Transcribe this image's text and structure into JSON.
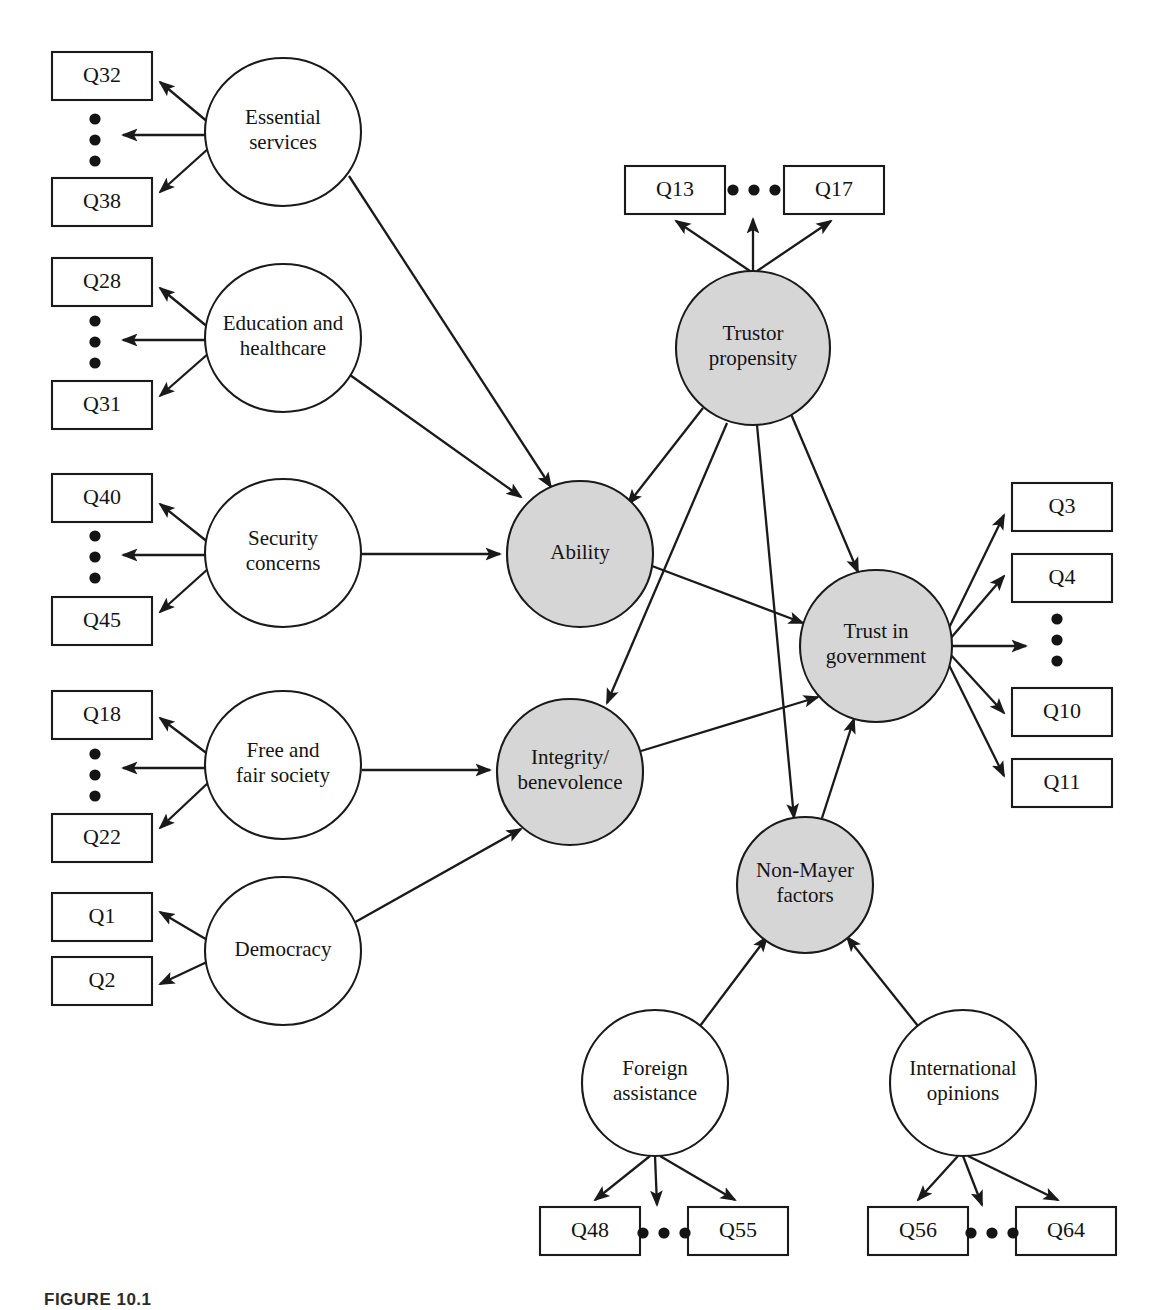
{
  "figure": {
    "caption": "FIGURE 10.1",
    "type": "structural-equation-model-path-diagram"
  },
  "colors": {
    "latent_shaded_fill": "#d6d6d6",
    "latent_plain_fill": "#ffffff",
    "stroke": "#1a1a1a",
    "box_fill": "#ffffff",
    "text": "#141414"
  },
  "legend_semantics": {
    "shaded_circle_meaning": "Mayer-model / endogenous latent construct",
    "plain_circle_meaning": "Observed exogenous latent construct",
    "rectangle_meaning": "Survey question indicator",
    "ellipsis_meaning": "Intermediate indicator items omitted"
  },
  "nodes": [
    {
      "id": "essential_services",
      "label_lines": [
        "Essential",
        "services"
      ],
      "shaded": false,
      "cx": 283,
      "cy": 132,
      "rx": 78,
      "ry": 74
    },
    {
      "id": "education_healthcare",
      "label_lines": [
        "Education and",
        "healthcare"
      ],
      "shaded": false,
      "cx": 283,
      "cy": 338,
      "rx": 78,
      "ry": 74
    },
    {
      "id": "security_concerns",
      "label_lines": [
        "Security",
        "concerns"
      ],
      "shaded": false,
      "cx": 283,
      "cy": 553,
      "rx": 78,
      "ry": 74
    },
    {
      "id": "free_fair_society",
      "label_lines": [
        "Free and",
        "fair society"
      ],
      "shaded": false,
      "cx": 283,
      "cy": 765,
      "rx": 78,
      "ry": 74
    },
    {
      "id": "democracy",
      "label_lines": [
        "Democracy"
      ],
      "shaded": false,
      "cx": 283,
      "cy": 951,
      "rx": 78,
      "ry": 74
    },
    {
      "id": "ability",
      "label_lines": [
        "Ability"
      ],
      "shaded": true,
      "cx": 580,
      "cy": 554,
      "rx": 73,
      "ry": 73
    },
    {
      "id": "integrity_benevolence",
      "label_lines": [
        "Integrity/",
        "benevolence"
      ],
      "shaded": true,
      "cx": 570,
      "cy": 772,
      "rx": 73,
      "ry": 73
    },
    {
      "id": "trustor_propensity",
      "label_lines": [
        "Trustor",
        "propensity"
      ],
      "shaded": true,
      "cx": 753,
      "cy": 348,
      "rx": 77,
      "ry": 77
    },
    {
      "id": "trust_in_government",
      "label_lines": [
        "Trust in",
        "government"
      ],
      "shaded": true,
      "cx": 876,
      "cy": 646,
      "rx": 76,
      "ry": 76
    },
    {
      "id": "non_mayer_factors",
      "label_lines": [
        "Non-Mayer",
        "factors"
      ],
      "shaded": true,
      "cx": 805,
      "cy": 885,
      "rx": 68,
      "ry": 68
    },
    {
      "id": "foreign_assistance",
      "label_lines": [
        "Foreign",
        "assistance"
      ],
      "shaded": false,
      "cx": 655,
      "cy": 1083,
      "rx": 73,
      "ry": 73
    },
    {
      "id": "international_opinions",
      "label_lines": [
        "International",
        "opinions"
      ],
      "shaded": false,
      "cx": 963,
      "cy": 1083,
      "rx": 73,
      "ry": 73
    }
  ],
  "indicator_boxes": [
    {
      "id": "q32",
      "label": "Q32",
      "x": 52,
      "y": 52,
      "w": 100,
      "h": 48
    },
    {
      "id": "q38",
      "label": "Q38",
      "x": 52,
      "y": 178,
      "w": 100,
      "h": 48
    },
    {
      "id": "q28",
      "label": "Q28",
      "x": 52,
      "y": 258,
      "w": 100,
      "h": 48
    },
    {
      "id": "q31",
      "label": "Q31",
      "x": 52,
      "y": 381,
      "w": 100,
      "h": 48
    },
    {
      "id": "q40",
      "label": "Q40",
      "x": 52,
      "y": 474,
      "w": 100,
      "h": 48
    },
    {
      "id": "q45",
      "label": "Q45",
      "x": 52,
      "y": 597,
      "w": 100,
      "h": 48
    },
    {
      "id": "q18",
      "label": "Q18",
      "x": 52,
      "y": 691,
      "w": 100,
      "h": 48
    },
    {
      "id": "q22",
      "label": "Q22",
      "x": 52,
      "y": 814,
      "w": 100,
      "h": 48
    },
    {
      "id": "q1",
      "label": "Q1",
      "x": 52,
      "y": 893,
      "w": 100,
      "h": 48
    },
    {
      "id": "q2",
      "label": "Q2",
      "x": 52,
      "y": 957,
      "w": 100,
      "h": 48
    },
    {
      "id": "q13",
      "label": "Q13",
      "x": 625,
      "y": 166,
      "w": 100,
      "h": 48
    },
    {
      "id": "q17",
      "label": "Q17",
      "x": 784,
      "y": 166,
      "w": 100,
      "h": 48
    },
    {
      "id": "q3",
      "label": "Q3",
      "x": 1012,
      "y": 483,
      "w": 100,
      "h": 48
    },
    {
      "id": "q4",
      "label": "Q4",
      "x": 1012,
      "y": 554,
      "w": 100,
      "h": 48
    },
    {
      "id": "q10",
      "label": "Q10",
      "x": 1012,
      "y": 688,
      "w": 100,
      "h": 48
    },
    {
      "id": "q11",
      "label": "Q11",
      "x": 1012,
      "y": 759,
      "w": 100,
      "h": 48
    },
    {
      "id": "q48",
      "label": "Q48",
      "x": 540,
      "y": 1207,
      "w": 100,
      "h": 48
    },
    {
      "id": "q55",
      "label": "Q55",
      "x": 688,
      "y": 1207,
      "w": 100,
      "h": 48
    },
    {
      "id": "q56",
      "label": "Q56",
      "x": 868,
      "y": 1207,
      "w": 100,
      "h": 48
    },
    {
      "id": "q64",
      "label": "Q64",
      "x": 1016,
      "y": 1207,
      "w": 100,
      "h": 48
    }
  ],
  "ellipses_markers": [
    {
      "id": "ellipsis_essential_services",
      "orientation": "vertical",
      "cx": 95,
      "cy": 140
    },
    {
      "id": "ellipsis_education_healthcare",
      "orientation": "vertical",
      "cx": 95,
      "cy": 342
    },
    {
      "id": "ellipsis_security_concerns",
      "orientation": "vertical",
      "cx": 95,
      "cy": 557
    },
    {
      "id": "ellipsis_free_fair_society",
      "orientation": "vertical",
      "cx": 95,
      "cy": 775
    },
    {
      "id": "ellipsis_trustor_propensity",
      "orientation": "horizontal",
      "cx": 754,
      "cy": 190
    },
    {
      "id": "ellipsis_trust_in_government",
      "orientation": "vertical",
      "cx": 1057,
      "cy": 640
    },
    {
      "id": "ellipsis_foreign_assistance",
      "orientation": "horizontal",
      "cx": 664,
      "cy": 1233
    },
    {
      "id": "ellipsis_international_opinions",
      "orientation": "horizontal",
      "cx": 992,
      "cy": 1233
    }
  ],
  "edges": [
    {
      "id": "essential_services-q32",
      "from": "essential_services",
      "to": "q32",
      "x1": 209,
      "y1": 123,
      "x2": 160,
      "y2": 82
    },
    {
      "id": "essential_services-dots",
      "from": "essential_services",
      "to": "ellipsis_essential_services",
      "x1": 206,
      "y1": 135,
      "x2": 123,
      "y2": 135
    },
    {
      "id": "essential_services-q38",
      "from": "essential_services",
      "to": "q38",
      "x1": 209,
      "y1": 148,
      "x2": 160,
      "y2": 192
    },
    {
      "id": "education_healthcare-q28",
      "from": "education_healthcare",
      "to": "q28",
      "x1": 209,
      "y1": 328,
      "x2": 160,
      "y2": 288
    },
    {
      "id": "education_healthcare-dots",
      "from": "education_healthcare",
      "to": "ellipsis_education_healthcare",
      "x1": 206,
      "y1": 340,
      "x2": 123,
      "y2": 340
    },
    {
      "id": "education_healthcare-q31",
      "from": "education_healthcare",
      "to": "q31",
      "x1": 209,
      "y1": 353,
      "x2": 160,
      "y2": 396
    },
    {
      "id": "security_concerns-q40",
      "from": "security_concerns",
      "to": "q40",
      "x1": 209,
      "y1": 543,
      "x2": 160,
      "y2": 504
    },
    {
      "id": "security_concerns-dots",
      "from": "security_concerns",
      "to": "ellipsis_security_concerns",
      "x1": 206,
      "y1": 555,
      "x2": 123,
      "y2": 555
    },
    {
      "id": "security_concerns-q45",
      "from": "security_concerns",
      "to": "q45",
      "x1": 209,
      "y1": 568,
      "x2": 160,
      "y2": 612
    },
    {
      "id": "free_fair_society-q18",
      "from": "free_fair_society",
      "to": "q18",
      "x1": 209,
      "y1": 755,
      "x2": 160,
      "y2": 718
    },
    {
      "id": "free_fair_society-dots",
      "from": "free_fair_society",
      "to": "ellipsis_free_fair_society",
      "x1": 206,
      "y1": 768,
      "x2": 123,
      "y2": 768
    },
    {
      "id": "free_fair_society-q22",
      "from": "free_fair_society",
      "to": "q22",
      "x1": 209,
      "y1": 782,
      "x2": 160,
      "y2": 828
    },
    {
      "id": "democracy-q1",
      "from": "democracy",
      "to": "q1",
      "x1": 209,
      "y1": 941,
      "x2": 160,
      "y2": 912
    },
    {
      "id": "democracy-q2",
      "from": "democracy",
      "to": "q2",
      "x1": 209,
      "y1": 961,
      "x2": 160,
      "y2": 984
    },
    {
      "id": "essential_services-ability",
      "from": "essential_services",
      "to": "ability",
      "x1": 349,
      "y1": 176,
      "x2": 551,
      "y2": 487
    },
    {
      "id": "education_healthcare-ability",
      "from": "education_healthcare",
      "to": "ability",
      "x1": 350,
      "y1": 375,
      "x2": 521,
      "y2": 497
    },
    {
      "id": "security_concerns-ability",
      "from": "security_concerns",
      "to": "ability",
      "x1": 362,
      "y1": 554,
      "x2": 500,
      "y2": 554
    },
    {
      "id": "free_fair_society-integrity",
      "from": "free_fair_society",
      "to": "integrity_benevolence",
      "x1": 362,
      "y1": 770,
      "x2": 490,
      "y2": 770
    },
    {
      "id": "democracy-integrity",
      "from": "democracy",
      "to": "integrity_benevolence",
      "x1": 350,
      "y1": 925,
      "x2": 521,
      "y2": 829
    },
    {
      "id": "trustor_propensity-q13",
      "from": "trustor_propensity",
      "to": "q13",
      "x1": 750,
      "y1": 271,
      "x2": 676,
      "y2": 221
    },
    {
      "id": "trustor_propensity-dots",
      "from": "trustor_propensity",
      "to": "ellipsis_trustor_propensity",
      "x1": 753,
      "y1": 271,
      "x2": 753,
      "y2": 219
    },
    {
      "id": "trustor_propensity-q17",
      "from": "trustor_propensity",
      "to": "q17",
      "x1": 757,
      "y1": 271,
      "x2": 831,
      "y2": 221
    },
    {
      "id": "trustor_propensity-ability",
      "from": "trustor_propensity",
      "to": "ability",
      "x1": 703,
      "y1": 408,
      "x2": 628,
      "y2": 504
    },
    {
      "id": "trustor_propensity-integrity",
      "from": "trustor_propensity",
      "to": "integrity_benevolence",
      "x1": 727,
      "y1": 423,
      "x2": 607,
      "y2": 703
    },
    {
      "id": "trustor_propensity-nonmayer",
      "from": "trustor_propensity",
      "to": "non_mayer_factors",
      "x1": 757,
      "y1": 425,
      "x2": 794,
      "y2": 818
    },
    {
      "id": "trustor_propensity-trust",
      "from": "trustor_propensity",
      "to": "trust_in_government",
      "x1": 791,
      "y1": 414,
      "x2": 858,
      "y2": 572
    },
    {
      "id": "ability-trust",
      "from": "ability",
      "to": "trust_in_government",
      "x1": 652,
      "y1": 566,
      "x2": 803,
      "y2": 623
    },
    {
      "id": "integrity-trust",
      "from": "integrity_benevolence",
      "to": "trust_in_government",
      "x1": 641,
      "y1": 751,
      "x2": 818,
      "y2": 697
    },
    {
      "id": "nonmayer-trust",
      "from": "non_mayer_factors",
      "to": "trust_in_government",
      "x1": 822,
      "y1": 818,
      "x2": 854,
      "y2": 719
    },
    {
      "id": "trust-q3",
      "from": "trust_in_government",
      "to": "q3",
      "x1": 947,
      "y1": 632,
      "x2": 1004,
      "y2": 515
    },
    {
      "id": "trust-q4",
      "from": "trust_in_government",
      "to": "q4",
      "x1": 950,
      "y1": 639,
      "x2": 1004,
      "y2": 576
    },
    {
      "id": "trust-dots",
      "from": "trust_in_government",
      "to": "ellipsis_trust_in_government",
      "x1": 952,
      "y1": 646,
      "x2": 1026,
      "y2": 646
    },
    {
      "id": "trust-q10",
      "from": "trust_in_government",
      "to": "q10",
      "x1": 950,
      "y1": 654,
      "x2": 1004,
      "y2": 713
    },
    {
      "id": "trust-q11",
      "from": "trust_in_government",
      "to": "q11",
      "x1": 947,
      "y1": 661,
      "x2": 1004,
      "y2": 776
    },
    {
      "id": "foreign_assistance-nonmayer",
      "from": "foreign_assistance",
      "to": "non_mayer_factors",
      "x1": 700,
      "y1": 1026,
      "x2": 767,
      "y2": 937
    },
    {
      "id": "international_opinions-nonmayer",
      "from": "international_opinions",
      "to": "non_mayer_factors",
      "x1": 918,
      "y1": 1026,
      "x2": 847,
      "y2": 937
    },
    {
      "id": "foreign_assistance-q48",
      "from": "foreign_assistance",
      "to": "q48",
      "x1": 650,
      "y1": 1156,
      "x2": 595,
      "y2": 1200
    },
    {
      "id": "foreign_assistance-dots",
      "from": "foreign_assistance",
      "to": "ellipsis_foreign_assistance",
      "x1": 655,
      "y1": 1156,
      "x2": 657,
      "y2": 1205
    },
    {
      "id": "foreign_assistance-q55",
      "from": "foreign_assistance",
      "to": "q55",
      "x1": 660,
      "y1": 1156,
      "x2": 735,
      "y2": 1200
    },
    {
      "id": "international_opinions-q56",
      "from": "international_opinions",
      "to": "q56",
      "x1": 958,
      "y1": 1156,
      "x2": 918,
      "y2": 1200
    },
    {
      "id": "international_opinions-dots",
      "from": "international_opinions",
      "to": "ellipsis_international_opinions",
      "x1": 963,
      "y1": 1156,
      "x2": 982,
      "y2": 1205
    },
    {
      "id": "international_opinions-q64",
      "from": "international_opinions",
      "to": "q64",
      "x1": 968,
      "y1": 1156,
      "x2": 1058,
      "y2": 1200
    }
  ]
}
